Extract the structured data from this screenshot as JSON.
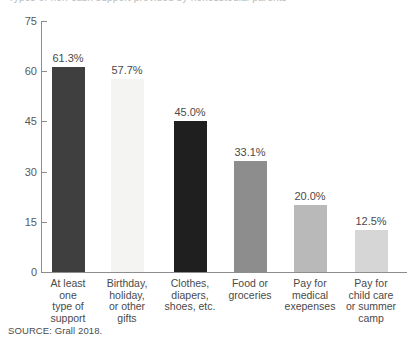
{
  "top_clipped_text": "Types of non-cash support provided by noncustodial parents",
  "source_note": "SOURCE: Grall 2018.",
  "axis": {
    "y_ticks": [
      "0",
      "15",
      "30",
      "45",
      "60",
      "75"
    ],
    "y_min": 0,
    "y_max": 75
  },
  "chart_data": {
    "type": "bar",
    "title": "",
    "xlabel": "",
    "ylabel": "",
    "ylim": [
      0,
      75
    ],
    "yticks": [
      0,
      15,
      30,
      45,
      60,
      75
    ],
    "grid": false,
    "legend": null,
    "categories": [
      "At least\none\ntype of\nsupport",
      "Birthday,\nholiday,\nor other\ngifts",
      "Clothes,\ndiapers,\nshoes, etc.",
      "Food or\ngroceries",
      "Pay for\nmedical\nexepenses",
      "Pay for\nchild care\nor summer\ncamp"
    ],
    "values": [
      61.3,
      57.7,
      45.0,
      33.1,
      20.0,
      12.5
    ],
    "data_labels": [
      "61.3%",
      "57.7%",
      "45.0%",
      "33.1%",
      "20.0%",
      "12.5%"
    ],
    "bar_colors": [
      "#3f3f3f",
      "#f4f4f2",
      "#1f1f1f",
      "#8d8d8d",
      "#b9b9b9",
      "#d6d6d6"
    ],
    "source": "SOURCE: Grall 2018."
  },
  "colors": {
    "axis": "#8d8d8d",
    "text": "#4a4a4a",
    "tick_text": "#595959",
    "background": "#ffffff"
  }
}
